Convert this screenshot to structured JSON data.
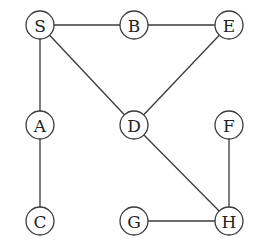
{
  "diagram": {
    "type": "undirected-graph",
    "node_radius": 14,
    "colors": {
      "stroke": "#3a3a3a",
      "text": "#222222",
      "fill": "#ffffff"
    },
    "nodes": [
      {
        "id": "S",
        "label": "S",
        "x": 40,
        "y": 25
      },
      {
        "id": "B",
        "label": "B",
        "x": 134,
        "y": 25
      },
      {
        "id": "E",
        "label": "E",
        "x": 229,
        "y": 25
      },
      {
        "id": "A",
        "label": "A",
        "x": 40,
        "y": 125
      },
      {
        "id": "D",
        "label": "D",
        "x": 134,
        "y": 125
      },
      {
        "id": "F",
        "label": "F",
        "x": 229,
        "y": 125
      },
      {
        "id": "C",
        "label": "C",
        "x": 40,
        "y": 221
      },
      {
        "id": "G",
        "label": "G",
        "x": 134,
        "y": 221
      },
      {
        "id": "H",
        "label": "H",
        "x": 229,
        "y": 221
      }
    ],
    "edges": [
      {
        "from": "S",
        "to": "B"
      },
      {
        "from": "B",
        "to": "E"
      },
      {
        "from": "S",
        "to": "A"
      },
      {
        "from": "S",
        "to": "D"
      },
      {
        "from": "E",
        "to": "D"
      },
      {
        "from": "A",
        "to": "C"
      },
      {
        "from": "D",
        "to": "H"
      },
      {
        "from": "F",
        "to": "H"
      },
      {
        "from": "G",
        "to": "H"
      }
    ]
  }
}
